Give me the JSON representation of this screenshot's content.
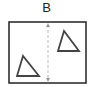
{
  "diagram": {
    "label": "B",
    "frame": {
      "x": 9,
      "y": 22,
      "width": 77,
      "height": 61,
      "stroke": "#222222"
    },
    "axis": {
      "type": "dashed-double-arrow",
      "x": 48,
      "y1": 23,
      "y2": 82,
      "stroke": "#bbbbbb"
    },
    "shapes": [
      {
        "type": "triangle",
        "name": "upper-right",
        "points": "64,31 58,51 79,51",
        "stroke": "#444444"
      },
      {
        "type": "triangle",
        "name": "lower-left",
        "points": "23,56 17,76 39,76",
        "stroke": "#444444"
      }
    ]
  }
}
